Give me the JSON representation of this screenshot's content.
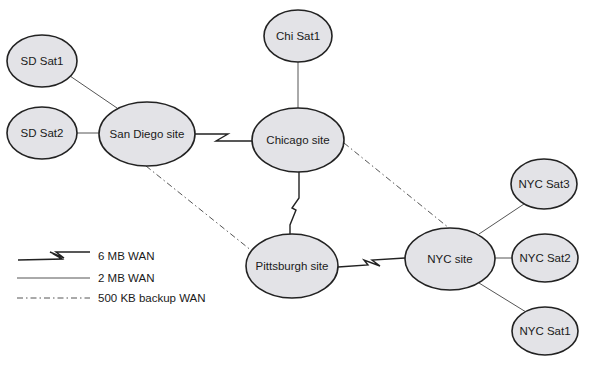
{
  "diagram": {
    "type": "network-topology",
    "nodes": [
      {
        "id": "sd_sat1",
        "label": "SD Sat1",
        "cx": 42,
        "cy": 61,
        "rx": 35,
        "ry": 26
      },
      {
        "id": "sd_sat2",
        "label": "SD Sat2",
        "cx": 42,
        "cy": 133,
        "rx": 35,
        "ry": 26
      },
      {
        "id": "san_diego",
        "label": "San Diego site",
        "cx": 147,
        "cy": 134,
        "rx": 48,
        "ry": 32
      },
      {
        "id": "chi_sat1",
        "label": "Chi Sat1",
        "cx": 298,
        "cy": 36,
        "rx": 34,
        "ry": 26
      },
      {
        "id": "chicago",
        "label": "Chicago site",
        "cx": 298,
        "cy": 140,
        "rx": 46,
        "ry": 32
      },
      {
        "id": "pittsburgh",
        "label": "Pittsburgh site",
        "cx": 292,
        "cy": 266,
        "rx": 46,
        "ry": 32
      },
      {
        "id": "nyc",
        "label": "NYC site",
        "cx": 450,
        "cy": 259,
        "rx": 45,
        "ry": 31
      },
      {
        "id": "nyc_sat3",
        "label": "NYC Sat3",
        "cx": 544,
        "cy": 184,
        "rx": 33,
        "ry": 25
      },
      {
        "id": "nyc_sat2",
        "label": "NYC Sat2",
        "cx": 545,
        "cy": 258,
        "rx": 33,
        "ry": 24
      },
      {
        "id": "nyc_sat1",
        "label": "NYC Sat1",
        "cx": 545,
        "cy": 331,
        "rx": 33,
        "ry": 24
      }
    ],
    "edges": [
      {
        "from": "sd_sat1",
        "to": "san_diego",
        "type": "2 MB WAN"
      },
      {
        "from": "sd_sat2",
        "to": "san_diego",
        "type": "2 MB WAN"
      },
      {
        "from": "chi_sat1",
        "to": "chicago",
        "type": "2 MB WAN"
      },
      {
        "from": "nyc_sat3",
        "to": "nyc",
        "type": "2 MB WAN"
      },
      {
        "from": "nyc_sat2",
        "to": "nyc",
        "type": "2 MB WAN"
      },
      {
        "from": "nyc_sat1",
        "to": "nyc",
        "type": "2 MB WAN"
      },
      {
        "from": "san_diego",
        "to": "chicago",
        "type": "6 MB WAN"
      },
      {
        "from": "chicago",
        "to": "pittsburgh",
        "type": "6 MB WAN"
      },
      {
        "from": "pittsburgh",
        "to": "nyc",
        "type": "6 MB WAN"
      },
      {
        "from": "san_diego",
        "to": "pittsburgh",
        "type": "500 KB backup WAN"
      },
      {
        "from": "chicago",
        "to": "nyc",
        "type": "500 KB backup WAN"
      }
    ]
  },
  "legend": {
    "items": [
      {
        "style": "lightning",
        "label": "6 MB WAN"
      },
      {
        "style": "solid",
        "label": "2 MB WAN"
      },
      {
        "style": "dash-dot",
        "label": "500 KB backup WAN"
      }
    ]
  },
  "colors": {
    "node_fill": "#e3e3e7",
    "node_stroke": "#222222",
    "line": "#555555",
    "background": "#ffffff"
  }
}
